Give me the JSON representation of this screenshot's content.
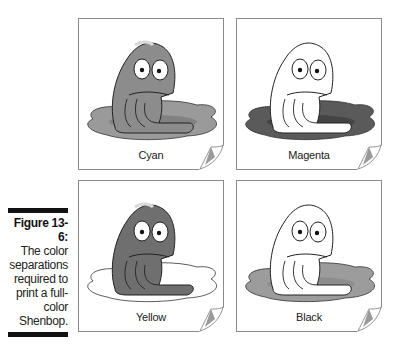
{
  "figure": {
    "label": "Figure 13-6:",
    "caption_lines": [
      "The color",
      "separations",
      "required to",
      "print a full-",
      "color",
      "Shenbop."
    ]
  },
  "panels": [
    {
      "label": "Cyan",
      "body_fill": "#8c8c8c",
      "pond_fill": "#9a9a9a",
      "pond_shadow": "#7a7a7a"
    },
    {
      "label": "Magenta",
      "body_fill": "#ffffff",
      "pond_fill": "#5a5a5a",
      "pond_shadow": "#3f3f3f"
    },
    {
      "label": "Yellow",
      "body_fill": "#6f6f6f",
      "pond_fill": "#ffffff",
      "pond_shadow": "#ffffff"
    },
    {
      "label": "Black",
      "body_fill": "#ffffff",
      "pond_fill": "#9c9c9c",
      "pond_shadow": "#8a8a8a"
    }
  ]
}
